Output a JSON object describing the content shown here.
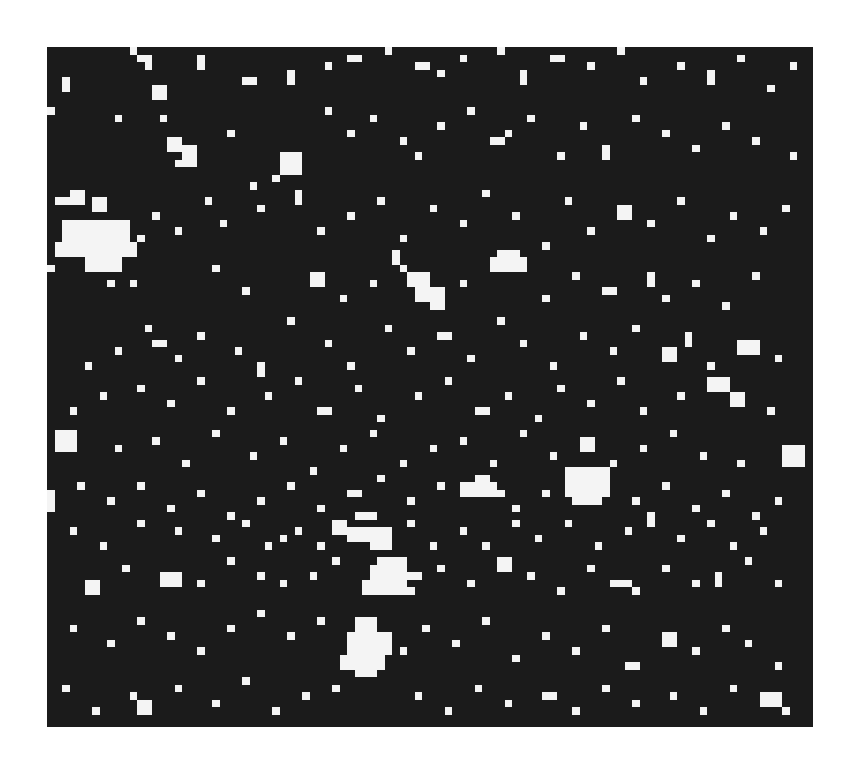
{
  "figure": {
    "background": "#ffffff",
    "panel": {
      "x": 47,
      "y": 47,
      "width": 766,
      "height": 680,
      "color": "#1b1b1b"
    },
    "cell_color": "#f4f4f4",
    "grid": {
      "cols": 102,
      "rows": 90,
      "cell": 7.5
    },
    "cells": [
      [
        11,
        0,
        1,
        1
      ],
      [
        12,
        1,
        2,
        1
      ],
      [
        13,
        2,
        1,
        1
      ],
      [
        20,
        1,
        1,
        2
      ],
      [
        26,
        4,
        2,
        1
      ],
      [
        9,
        9,
        1,
        1
      ],
      [
        14,
        5,
        2,
        2
      ],
      [
        15,
        9,
        1,
        1
      ],
      [
        2,
        4,
        1,
        2
      ],
      [
        0,
        8,
        1,
        1
      ],
      [
        32,
        3,
        1,
        2
      ],
      [
        37,
        2,
        1,
        1
      ],
      [
        40,
        1,
        2,
        1
      ],
      [
        45,
        0,
        1,
        1
      ],
      [
        49,
        2,
        2,
        1
      ],
      [
        52,
        3,
        1,
        1
      ],
      [
        55,
        1,
        1,
        1
      ],
      [
        60,
        0,
        1,
        1
      ],
      [
        63,
        3,
        1,
        2
      ],
      [
        67,
        1,
        2,
        1
      ],
      [
        72,
        2,
        1,
        1
      ],
      [
        76,
        0,
        1,
        1
      ],
      [
        79,
        4,
        1,
        1
      ],
      [
        84,
        2,
        1,
        1
      ],
      [
        88,
        3,
        1,
        2
      ],
      [
        92,
        1,
        1,
        1
      ],
      [
        96,
        5,
        1,
        1
      ],
      [
        99,
        2,
        1,
        1
      ],
      [
        16,
        12,
        2,
        2
      ],
      [
        18,
        13,
        2,
        3
      ],
      [
        17,
        15,
        1,
        1
      ],
      [
        31,
        14,
        3,
        3
      ],
      [
        30,
        17,
        1,
        1
      ],
      [
        24,
        11,
        1,
        1
      ],
      [
        27,
        18,
        1,
        1
      ],
      [
        37,
        8,
        1,
        1
      ],
      [
        40,
        11,
        1,
        1
      ],
      [
        43,
        9,
        1,
        1
      ],
      [
        47,
        12,
        1,
        1
      ],
      [
        49,
        14,
        1,
        1
      ],
      [
        52,
        10,
        1,
        1
      ],
      [
        56,
        8,
        1,
        1
      ],
      [
        59,
        12,
        2,
        1
      ],
      [
        61,
        11,
        1,
        1
      ],
      [
        64,
        9,
        1,
        1
      ],
      [
        68,
        14,
        1,
        1
      ],
      [
        71,
        10,
        1,
        1
      ],
      [
        74,
        13,
        1,
        2
      ],
      [
        78,
        9,
        1,
        1
      ],
      [
        82,
        11,
        1,
        1
      ],
      [
        86,
        13,
        1,
        1
      ],
      [
        90,
        10,
        1,
        1
      ],
      [
        94,
        12,
        1,
        1
      ],
      [
        99,
        14,
        1,
        1
      ],
      [
        1,
        20,
        2,
        1
      ],
      [
        3,
        19,
        2,
        2
      ],
      [
        6,
        20,
        2,
        2
      ],
      [
        2,
        23,
        5,
        3
      ],
      [
        7,
        23,
        4,
        3
      ],
      [
        1,
        26,
        9,
        2
      ],
      [
        5,
        28,
        5,
        2
      ],
      [
        10,
        26,
        2,
        2
      ],
      [
        12,
        25,
        1,
        1
      ],
      [
        0,
        29,
        1,
        1
      ],
      [
        8,
        31,
        1,
        1
      ],
      [
        11,
        31,
        1,
        1
      ],
      [
        14,
        22,
        1,
        1
      ],
      [
        17,
        24,
        1,
        1
      ],
      [
        21,
        20,
        1,
        1
      ],
      [
        23,
        23,
        1,
        1
      ],
      [
        28,
        21,
        1,
        1
      ],
      [
        33,
        19,
        1,
        2
      ],
      [
        36,
        24,
        1,
        1
      ],
      [
        40,
        22,
        1,
        1
      ],
      [
        44,
        20,
        1,
        1
      ],
      [
        47,
        25,
        1,
        1
      ],
      [
        51,
        21,
        1,
        1
      ],
      [
        55,
        23,
        1,
        1
      ],
      [
        58,
        19,
        1,
        1
      ],
      [
        62,
        22,
        1,
        1
      ],
      [
        66,
        26,
        1,
        1
      ],
      [
        69,
        20,
        1,
        1
      ],
      [
        72,
        24,
        1,
        1
      ],
      [
        76,
        21,
        2,
        2
      ],
      [
        80,
        23,
        1,
        1
      ],
      [
        84,
        20,
        1,
        1
      ],
      [
        88,
        25,
        1,
        1
      ],
      [
        91,
        22,
        1,
        1
      ],
      [
        95,
        24,
        1,
        1
      ],
      [
        98,
        21,
        1,
        1
      ],
      [
        60,
        27,
        3,
        1
      ],
      [
        59,
        28,
        5,
        2
      ],
      [
        46,
        27,
        1,
        2
      ],
      [
        47,
        29,
        1,
        1
      ],
      [
        48,
        30,
        3,
        2
      ],
      [
        49,
        32,
        4,
        2
      ],
      [
        51,
        34,
        2,
        1
      ],
      [
        22,
        29,
        1,
        1
      ],
      [
        26,
        32,
        1,
        1
      ],
      [
        35,
        30,
        2,
        2
      ],
      [
        39,
        33,
        1,
        1
      ],
      [
        43,
        31,
        1,
        1
      ],
      [
        55,
        31,
        1,
        1
      ],
      [
        66,
        33,
        1,
        1
      ],
      [
        70,
        30,
        1,
        1
      ],
      [
        74,
        32,
        2,
        1
      ],
      [
        80,
        30,
        1,
        2
      ],
      [
        82,
        33,
        1,
        1
      ],
      [
        86,
        31,
        1,
        1
      ],
      [
        90,
        34,
        1,
        1
      ],
      [
        94,
        30,
        1,
        1
      ],
      [
        13,
        37,
        1,
        1
      ],
      [
        14,
        39,
        2,
        1
      ],
      [
        17,
        41,
        1,
        1
      ],
      [
        20,
        38,
        1,
        1
      ],
      [
        25,
        40,
        1,
        1
      ],
      [
        28,
        42,
        1,
        2
      ],
      [
        32,
        36,
        1,
        1
      ],
      [
        37,
        39,
        1,
        1
      ],
      [
        40,
        42,
        1,
        1
      ],
      [
        45,
        37,
        1,
        1
      ],
      [
        48,
        40,
        1,
        1
      ],
      [
        52,
        38,
        2,
        1
      ],
      [
        56,
        41,
        1,
        1
      ],
      [
        60,
        36,
        1,
        1
      ],
      [
        63,
        39,
        1,
        1
      ],
      [
        67,
        42,
        1,
        1
      ],
      [
        71,
        38,
        1,
        1
      ],
      [
        75,
        40,
        1,
        1
      ],
      [
        78,
        37,
        1,
        1
      ],
      [
        82,
        40,
        2,
        2
      ],
      [
        85,
        38,
        1,
        2
      ],
      [
        88,
        42,
        1,
        1
      ],
      [
        92,
        39,
        3,
        2
      ],
      [
        97,
        41,
        1,
        1
      ],
      [
        5,
        42,
        1,
        1
      ],
      [
        9,
        40,
        1,
        1
      ],
      [
        12,
        45,
        1,
        1
      ],
      [
        16,
        47,
        1,
        1
      ],
      [
        20,
        44,
        1,
        1
      ],
      [
        24,
        48,
        1,
        1
      ],
      [
        29,
        46,
        1,
        1
      ],
      [
        33,
        44,
        1,
        1
      ],
      [
        36,
        48,
        2,
        1
      ],
      [
        41,
        45,
        1,
        1
      ],
      [
        44,
        49,
        1,
        1
      ],
      [
        49,
        46,
        1,
        1
      ],
      [
        53,
        44,
        1,
        1
      ],
      [
        57,
        48,
        2,
        1
      ],
      [
        61,
        46,
        1,
        1
      ],
      [
        65,
        49,
        1,
        1
      ],
      [
        68,
        45,
        1,
        1
      ],
      [
        72,
        47,
        1,
        1
      ],
      [
        76,
        44,
        1,
        1
      ],
      [
        79,
        48,
        1,
        1
      ],
      [
        84,
        46,
        1,
        1
      ],
      [
        88,
        44,
        3,
        2
      ],
      [
        91,
        46,
        2,
        2
      ],
      [
        96,
        48,
        1,
        1
      ],
      [
        3,
        48,
        1,
        1
      ],
      [
        7,
        46,
        1,
        1
      ],
      [
        1,
        51,
        3,
        3
      ],
      [
        9,
        53,
        1,
        1
      ],
      [
        14,
        52,
        1,
        1
      ],
      [
        18,
        55,
        1,
        1
      ],
      [
        22,
        51,
        1,
        1
      ],
      [
        27,
        54,
        1,
        1
      ],
      [
        31,
        52,
        1,
        1
      ],
      [
        35,
        56,
        1,
        1
      ],
      [
        39,
        53,
        1,
        1
      ],
      [
        43,
        51,
        1,
        1
      ],
      [
        47,
        55,
        1,
        1
      ],
      [
        51,
        53,
        1,
        1
      ],
      [
        55,
        52,
        1,
        1
      ],
      [
        59,
        55,
        1,
        1
      ],
      [
        63,
        51,
        1,
        1
      ],
      [
        67,
        54,
        1,
        1
      ],
      [
        71,
        52,
        2,
        2
      ],
      [
        75,
        55,
        1,
        1
      ],
      [
        79,
        53,
        1,
        1
      ],
      [
        83,
        51,
        1,
        1
      ],
      [
        87,
        54,
        1,
        1
      ],
      [
        98,
        53,
        3,
        3
      ],
      [
        92,
        55,
        1,
        1
      ],
      [
        69,
        56,
        6,
        4
      ],
      [
        70,
        60,
        4,
        1
      ],
      [
        66,
        59,
        1,
        1
      ],
      [
        0,
        59,
        1,
        3
      ],
      [
        4,
        58,
        1,
        1
      ],
      [
        8,
        60,
        1,
        1
      ],
      [
        12,
        58,
        1,
        1
      ],
      [
        16,
        61,
        1,
        1
      ],
      [
        20,
        59,
        1,
        1
      ],
      [
        24,
        62,
        1,
        1
      ],
      [
        28,
        60,
        1,
        1
      ],
      [
        32,
        58,
        1,
        1
      ],
      [
        36,
        61,
        1,
        1
      ],
      [
        40,
        59,
        2,
        1
      ],
      [
        44,
        57,
        1,
        1
      ],
      [
        48,
        60,
        1,
        1
      ],
      [
        52,
        58,
        1,
        1
      ],
      [
        55,
        58,
        5,
        1
      ],
      [
        57,
        57,
        2,
        1
      ],
      [
        55,
        59,
        6,
        1
      ],
      [
        62,
        61,
        1,
        1
      ],
      [
        78,
        60,
        1,
        1
      ],
      [
        82,
        58,
        1,
        1
      ],
      [
        86,
        61,
        1,
        1
      ],
      [
        90,
        59,
        1,
        1
      ],
      [
        94,
        62,
        1,
        1
      ],
      [
        97,
        60,
        1,
        1
      ],
      [
        38,
        63,
        2,
        2
      ],
      [
        41,
        62,
        3,
        1
      ],
      [
        40,
        64,
        6,
        2
      ],
      [
        43,
        66,
        3,
        1
      ],
      [
        36,
        66,
        1,
        1
      ],
      [
        33,
        64,
        1,
        1
      ],
      [
        31,
        65,
        1,
        1
      ],
      [
        29,
        66,
        1,
        1
      ],
      [
        26,
        63,
        1,
        1
      ],
      [
        22,
        65,
        1,
        1
      ],
      [
        17,
        64,
        1,
        1
      ],
      [
        12,
        63,
        1,
        1
      ],
      [
        7,
        66,
        1,
        1
      ],
      [
        3,
        64,
        1,
        1
      ],
      [
        48,
        63,
        1,
        1
      ],
      [
        51,
        66,
        1,
        1
      ],
      [
        55,
        64,
        1,
        1
      ],
      [
        58,
        66,
        1,
        1
      ],
      [
        62,
        63,
        1,
        1
      ],
      [
        65,
        65,
        1,
        1
      ],
      [
        69,
        63,
        1,
        1
      ],
      [
        73,
        66,
        1,
        1
      ],
      [
        77,
        64,
        1,
        1
      ],
      [
        80,
        62,
        1,
        2
      ],
      [
        84,
        65,
        1,
        1
      ],
      [
        88,
        63,
        1,
        1
      ],
      [
        91,
        66,
        1,
        1
      ],
      [
        95,
        64,
        1,
        1
      ],
      [
        44,
        68,
        4,
        4
      ],
      [
        43,
        69,
        1,
        3
      ],
      [
        42,
        71,
        5,
        2
      ],
      [
        48,
        70,
        2,
        1
      ],
      [
        47,
        72,
        2,
        1
      ],
      [
        38,
        68,
        1,
        1
      ],
      [
        35,
        70,
        1,
        1
      ],
      [
        31,
        71,
        1,
        1
      ],
      [
        28,
        70,
        1,
        1
      ],
      [
        24,
        68,
        1,
        1
      ],
      [
        20,
        71,
        1,
        1
      ],
      [
        15,
        70,
        3,
        2
      ],
      [
        10,
        69,
        1,
        1
      ],
      [
        5,
        71,
        2,
        2
      ],
      [
        52,
        69,
        1,
        1
      ],
      [
        56,
        71,
        1,
        1
      ],
      [
        60,
        68,
        2,
        2
      ],
      [
        64,
        70,
        1,
        1
      ],
      [
        68,
        72,
        1,
        1
      ],
      [
        72,
        69,
        1,
        1
      ],
      [
        75,
        71,
        3,
        1
      ],
      [
        78,
        72,
        1,
        1
      ],
      [
        82,
        69,
        1,
        1
      ],
      [
        86,
        71,
        1,
        1
      ],
      [
        89,
        70,
        1,
        2
      ],
      [
        93,
        68,
        1,
        1
      ],
      [
        97,
        71,
        1,
        1
      ],
      [
        41,
        76,
        3,
        2
      ],
      [
        40,
        78,
        6,
        3
      ],
      [
        39,
        81,
        6,
        2
      ],
      [
        41,
        83,
        3,
        1
      ],
      [
        47,
        80,
        1,
        1
      ],
      [
        36,
        76,
        1,
        1
      ],
      [
        32,
        78,
        1,
        1
      ],
      [
        28,
        75,
        1,
        1
      ],
      [
        24,
        77,
        1,
        1
      ],
      [
        20,
        80,
        1,
        1
      ],
      [
        16,
        78,
        1,
        1
      ],
      [
        12,
        76,
        1,
        1
      ],
      [
        8,
        79,
        1,
        1
      ],
      [
        3,
        77,
        1,
        1
      ],
      [
        50,
        77,
        1,
        1
      ],
      [
        54,
        79,
        1,
        1
      ],
      [
        58,
        76,
        1,
        1
      ],
      [
        62,
        81,
        1,
        1
      ],
      [
        66,
        78,
        1,
        1
      ],
      [
        70,
        80,
        1,
        1
      ],
      [
        74,
        77,
        1,
        1
      ],
      [
        77,
        82,
        2,
        1
      ],
      [
        82,
        78,
        2,
        2
      ],
      [
        86,
        80,
        1,
        1
      ],
      [
        90,
        77,
        1,
        1
      ],
      [
        93,
        79,
        1,
        1
      ],
      [
        97,
        82,
        1,
        1
      ],
      [
        12,
        87,
        2,
        2
      ],
      [
        11,
        86,
        1,
        1
      ],
      [
        2,
        85,
        1,
        1
      ],
      [
        6,
        88,
        1,
        1
      ],
      [
        17,
        85,
        1,
        1
      ],
      [
        22,
        87,
        1,
        1
      ],
      [
        26,
        84,
        1,
        1
      ],
      [
        30,
        88,
        1,
        1
      ],
      [
        34,
        86,
        1,
        1
      ],
      [
        38,
        85,
        1,
        1
      ],
      [
        49,
        86,
        1,
        1
      ],
      [
        53,
        88,
        1,
        1
      ],
      [
        57,
        85,
        1,
        1
      ],
      [
        61,
        87,
        1,
        1
      ],
      [
        66,
        86,
        2,
        1
      ],
      [
        70,
        88,
        1,
        1
      ],
      [
        74,
        85,
        1,
        1
      ],
      [
        78,
        87,
        1,
        1
      ],
      [
        83,
        86,
        1,
        1
      ],
      [
        87,
        88,
        1,
        1
      ],
      [
        95,
        86,
        3,
        2
      ],
      [
        98,
        88,
        1,
        1
      ],
      [
        91,
        85,
        1,
        1
      ]
    ]
  }
}
